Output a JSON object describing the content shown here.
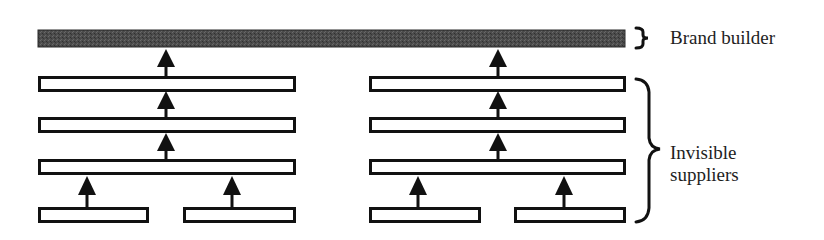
{
  "diagram": {
    "type": "hierarchy",
    "colors": {
      "brand_bar": "#4a4a4a",
      "outline": "#111111",
      "background": "#ffffff",
      "text": "#1e1e1e"
    },
    "labels": {
      "brand_builder": "Brand builder",
      "invisible_suppliers_line1": "Invisible",
      "invisible_suppliers_line2": "suppliers"
    },
    "layers": [
      {
        "name": "brand-builder",
        "count": 1,
        "filled": true
      },
      {
        "name": "tier-1-suppliers",
        "count": 2,
        "filled": false
      },
      {
        "name": "tier-2-suppliers",
        "count": 2,
        "filled": false
      },
      {
        "name": "tier-3-suppliers",
        "count": 2,
        "filled": false
      },
      {
        "name": "tier-4-suppliers",
        "count": 4,
        "filled": false
      }
    ],
    "groups": [
      "left-chain",
      "right-chain"
    ]
  }
}
